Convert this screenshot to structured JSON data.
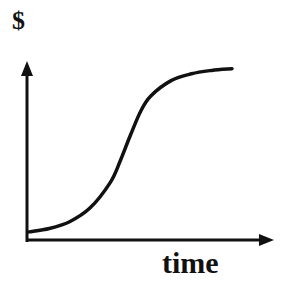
{
  "chart_data": {
    "type": "line",
    "title": "",
    "xlabel": "time",
    "ylabel": "$",
    "grid": false,
    "legend": null,
    "ticks": {
      "x": [],
      "y": []
    },
    "series": [
      {
        "name": "S-curve",
        "shape": "sigmoid (slow start, rapid growth, plateau)",
        "x": [
          0,
          0.1,
          0.2,
          0.3,
          0.4,
          0.45,
          0.5,
          0.55,
          0.6,
          0.7,
          0.8,
          0.9,
          1.0
        ],
        "y": [
          0.03,
          0.05,
          0.09,
          0.17,
          0.32,
          0.45,
          0.6,
          0.74,
          0.83,
          0.92,
          0.96,
          0.98,
          0.99
        ]
      }
    ],
    "xlim": [
      0,
      1
    ],
    "ylim": [
      0,
      1
    ]
  },
  "colors": {
    "line": "#111111",
    "background": "#ffffff"
  }
}
